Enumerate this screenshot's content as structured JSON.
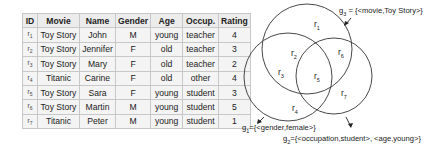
{
  "table": {
    "headers": [
      "ID",
      "Movie",
      "Name",
      "Gender",
      "Age",
      "Occup.",
      "Rating"
    ],
    "rows": [
      {
        "id": "r1",
        "movie": "Toy Story",
        "name": "John",
        "gender": "M",
        "age": "young",
        "occup": "teacher",
        "rating": "4"
      },
      {
        "id": "r2",
        "movie": "Toy Story",
        "name": "Jennifer",
        "gender": "F",
        "age": "old",
        "occup": "teacher",
        "rating": "3"
      },
      {
        "id": "r3",
        "movie": "Toy Story",
        "name": "Mary",
        "gender": "F",
        "age": "old",
        "occup": "teacher",
        "rating": "2"
      },
      {
        "id": "r4",
        "movie": "Titanic",
        "name": "Carine",
        "gender": "F",
        "age": "old",
        "occup": "other",
        "rating": "4"
      },
      {
        "id": "r5",
        "movie": "Toy Story",
        "name": "Sara",
        "gender": "F",
        "age": "young",
        "occup": "student",
        "rating": "3"
      },
      {
        "id": "r6",
        "movie": "Toy Story",
        "name": "Martin",
        "gender": "M",
        "age": "young",
        "occup": "student",
        "rating": "5"
      },
      {
        "id": "r7",
        "movie": "Titanic",
        "name": "Peter",
        "gender": "M",
        "age": "young",
        "occup": "student",
        "rating": "1"
      }
    ]
  },
  "venn": {
    "groups": {
      "g1": {
        "name": "g",
        "sub": "1",
        "desc": "={<gender,female>}"
      },
      "g2": {
        "name": "g",
        "sub": "2",
        "desc": "={<occupation,student>, <age,young>}"
      },
      "g3": {
        "name": "g",
        "sub": "3",
        "desc": " = {<movie,Toy Story>}"
      }
    },
    "regions": {
      "r1": {
        "name": "r",
        "sub": "1"
      },
      "r2": {
        "name": "r",
        "sub": "2"
      },
      "r3": {
        "name": "r",
        "sub": "3"
      },
      "r4": {
        "name": "r",
        "sub": "4"
      },
      "r5": {
        "name": "r",
        "sub": "5"
      },
      "r6": {
        "name": "r",
        "sub": "6"
      },
      "r7": {
        "name": "r",
        "sub": "7"
      }
    },
    "colors": {
      "stroke": "#333333",
      "text": "#222222"
    }
  }
}
